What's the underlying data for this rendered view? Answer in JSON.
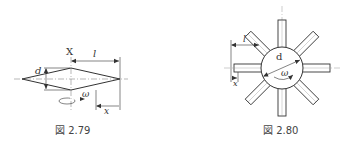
{
  "figures": [
    {
      "id": "fig-2-79",
      "caption": "図 2.79",
      "labels": {
        "axis": "X",
        "length": "l",
        "diameter": "d",
        "angular_velocity": "ω",
        "distance": "x"
      }
    },
    {
      "id": "fig-2-80",
      "caption": "図 2.80",
      "labels": {
        "length": "l",
        "diameter": "d",
        "angular_velocity": "ω",
        "distance": "x"
      },
      "spoke_count": 8
    }
  ],
  "colors": {
    "line": "#333333",
    "centerline": "#777777",
    "background": "#ffffff"
  }
}
